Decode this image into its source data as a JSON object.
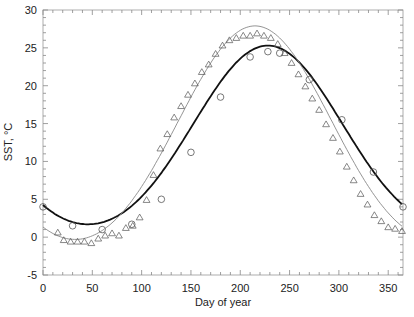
{
  "chart_data": {
    "type": "scatter",
    "title": "",
    "xlabel": "Day of year",
    "ylabel": "SST, °C",
    "xlim": [
      0,
      365
    ],
    "ylim": [
      -5,
      30
    ],
    "xticks": [
      0,
      50,
      100,
      150,
      200,
      250,
      300,
      350
    ],
    "yticks": [
      -5,
      0,
      5,
      10,
      15,
      20,
      25,
      30
    ],
    "grid": false,
    "legend": null,
    "series": [
      {
        "name": "circles",
        "marker": "circle",
        "color": "#555555",
        "points": [
          [
            0,
            4.0
          ],
          [
            30,
            1.5
          ],
          [
            60,
            1.0
          ],
          [
            90,
            1.7
          ],
          [
            120,
            5.0
          ],
          [
            150,
            11.2
          ],
          [
            180,
            18.5
          ],
          [
            210,
            23.8
          ],
          [
            228,
            24.5
          ],
          [
            240,
            24.3
          ],
          [
            270,
            20.8
          ],
          [
            303,
            15.5
          ],
          [
            335,
            8.6
          ],
          [
            365,
            4.0
          ]
        ]
      },
      {
        "name": "triangles",
        "marker": "triangle",
        "color": "#555555",
        "points": [
          [
            15,
            0.6
          ],
          [
            21,
            -0.4
          ],
          [
            28,
            -0.6
          ],
          [
            35,
            -0.6
          ],
          [
            42,
            -0.6
          ],
          [
            49,
            -0.8
          ],
          [
            56,
            -0.2
          ],
          [
            63,
            0.2
          ],
          [
            70,
            0.5
          ],
          [
            77,
            0.2
          ],
          [
            84,
            1.2
          ],
          [
            91,
            1.5
          ],
          [
            98,
            2.6
          ],
          [
            105,
            4.9
          ],
          [
            112,
            8.2
          ],
          [
            119,
            11.7
          ],
          [
            126,
            13.6
          ],
          [
            133,
            15.8
          ],
          [
            140,
            17.3
          ],
          [
            147,
            18.8
          ],
          [
            154,
            20.3
          ],
          [
            161,
            21.8
          ],
          [
            168,
            22.8
          ],
          [
            175,
            24.2
          ],
          [
            182,
            25.3
          ],
          [
            189,
            26.0
          ],
          [
            196,
            26.3
          ],
          [
            203,
            26.6
          ],
          [
            210,
            26.6
          ],
          [
            217,
            26.9
          ],
          [
            224,
            26.6
          ],
          [
            231,
            26.3
          ],
          [
            238,
            25.5
          ],
          [
            245,
            24.3
          ],
          [
            252,
            23.0
          ],
          [
            259,
            21.5
          ],
          [
            266,
            19.9
          ],
          [
            273,
            18.3
          ],
          [
            280,
            16.8
          ],
          [
            287,
            14.9
          ],
          [
            294,
            13.1
          ],
          [
            301,
            11.3
          ],
          [
            308,
            9.3
          ],
          [
            315,
            7.5
          ],
          [
            322,
            5.7
          ],
          [
            329,
            4.3
          ],
          [
            336,
            2.9
          ],
          [
            343,
            2.1
          ],
          [
            350,
            1.3
          ],
          [
            357,
            1.1
          ],
          [
            364,
            0.8
          ]
        ]
      },
      {
        "name": "fit-circles",
        "style": "thick-line",
        "color": "#111111",
        "mean": 12.6,
        "amplitude": 11.8,
        "phase_day": 228
      },
      {
        "name": "fit-triangles",
        "style": "thin-line",
        "color": "#888888",
        "mean": 12.9,
        "amplitude": 14.1,
        "phase_day": 215
      }
    ]
  },
  "axes": {
    "xlabel": "Day of year",
    "ylabel": "SST, °C",
    "xtick_labels": [
      "0",
      "50",
      "100",
      "150",
      "200",
      "250",
      "300",
      "350"
    ],
    "ytick_labels": [
      "-5",
      "0",
      "5",
      "10",
      "15",
      "20",
      "25",
      "30"
    ]
  }
}
